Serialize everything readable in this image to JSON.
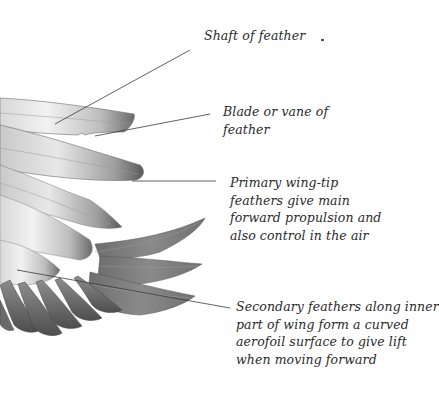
{
  "diagram": {
    "labels": [
      {
        "id": "shaft",
        "lines": [
          "Shaft of feather"
        ]
      },
      {
        "id": "blade",
        "lines": [
          "Blade or vane of",
          "feather"
        ]
      },
      {
        "id": "primary",
        "lines": [
          "Primary wing-tip",
          "feathers give main",
          "forward propulsion and",
          "also control in the air"
        ]
      },
      {
        "id": "secondary",
        "lines": [
          "Secondary feathers along inner",
          "part of wing form a curved",
          "aerofoil surface to give lift",
          "when moving forward"
        ]
      }
    ],
    "colors": {
      "background": "#ffffff",
      "text": "#2a2a2a",
      "leader_line": "#3a3a3a",
      "feather_dark": "#555555",
      "feather_light": "#e6e6e6"
    }
  }
}
